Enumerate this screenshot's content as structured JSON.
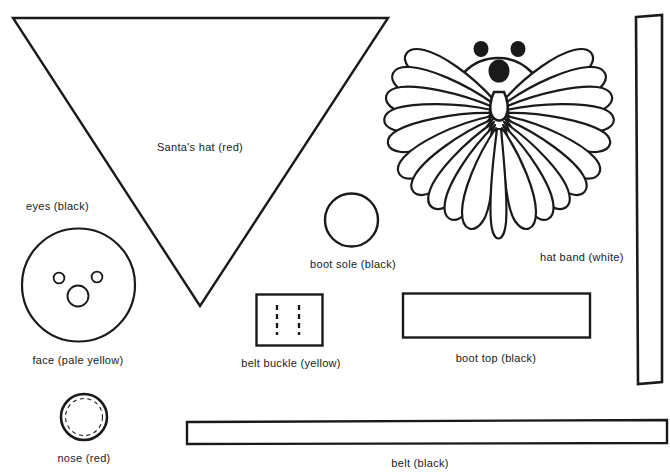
{
  "sheet": {
    "title": "Santa craft pattern template sheet",
    "background_color": "#ffffff",
    "ink_color": "#1a1a1a",
    "width": 670,
    "height": 476
  },
  "labels": {
    "santa_hat": "Santa's hat (red)",
    "eyes": "eyes (black)",
    "face": "face (pale yellow)",
    "nose": "nose (red)",
    "boot_sole": "boot sole (black)",
    "belt_buckle": "belt buckle (yellow)",
    "boot_top": "boot top (black)",
    "belt": "belt (black)",
    "hat_band": "hat band (white)"
  },
  "pieces": [
    {
      "name": "santa-hat",
      "shape": "triangle",
      "label": "Santa's hat (red)",
      "color_note": "red"
    },
    {
      "name": "face",
      "shape": "circle",
      "label": "face (pale yellow)",
      "color_note": "pale yellow"
    },
    {
      "name": "eyes",
      "shape": "small-circles",
      "label": "eyes (black)",
      "color_note": "black",
      "count": 2
    },
    {
      "name": "nose",
      "shape": "circle-dashed",
      "label": "nose (red)",
      "color_note": "red"
    },
    {
      "name": "boot-sole",
      "shape": "circle",
      "label": "boot sole (black)",
      "color_note": "black"
    },
    {
      "name": "belt-buckle",
      "shape": "rectangle-dashed",
      "label": "belt buckle (yellow)",
      "color_note": "yellow"
    },
    {
      "name": "boot-top",
      "shape": "rectangle",
      "label": "boot top (black)",
      "color_note": "black"
    },
    {
      "name": "belt",
      "shape": "long-strip",
      "label": "belt (black)",
      "color_note": "black"
    },
    {
      "name": "hat-band",
      "shape": "tall-strip",
      "label": "hat band (white)",
      "color_note": "white"
    },
    {
      "name": "pompom-santa",
      "shape": "yarn-pompom-figure",
      "label": "",
      "color_note": "finished craft illustration"
    }
  ]
}
